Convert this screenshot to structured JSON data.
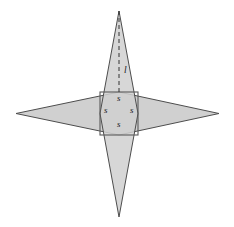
{
  "figure": {
    "background_color": "#ffffff",
    "fill_color": "#d0d0d0",
    "stroke_color": "#4d4d4d",
    "square_stroke_color": "#5a5a5a",
    "dashed_stroke_color": "#333333",
    "label_color": "#1a1a1a",
    "canvas": {
      "width": 234,
      "height": 227
    },
    "geometry": {
      "center": {
        "x": 119,
        "y": 113.5
      },
      "square": {
        "x": 100,
        "y": 92,
        "width": 38,
        "height": 43
      },
      "vertical_spike": {
        "apex_top": {
          "x": 119,
          "y": 11
        },
        "apex_bottom": {
          "x": 119,
          "y": 217
        },
        "left_waist": {
          "x": 100,
          "y": 113.5
        },
        "right_waist": {
          "x": 138,
          "y": 113.5
        }
      },
      "horizontal_spike": {
        "apex_left": {
          "x": 16,
          "y": 113.5
        },
        "apex_right": {
          "x": 219,
          "y": 113.5
        },
        "top_waist": {
          "x": 119,
          "y": 92
        },
        "bottom_waist": {
          "x": 119,
          "y": 135
        }
      },
      "dashed_line": {
        "from": {
          "x": 119,
          "y": 11
        },
        "to": {
          "x": 119,
          "y": 92
        }
      }
    },
    "labels": [
      {
        "id": "side-top",
        "text": "s",
        "x": 117,
        "y": 98,
        "name": "square-side-label-top"
      },
      {
        "id": "side-left",
        "text": "s",
        "x": 104,
        "y": 110,
        "name": "square-side-label-left"
      },
      {
        "id": "side-right",
        "text": "s",
        "x": 130,
        "y": 110,
        "name": "square-side-label-right"
      },
      {
        "id": "side-bottom",
        "text": "s",
        "x": 117,
        "y": 124,
        "name": "square-side-label-bottom"
      },
      {
        "id": "spike-height",
        "text": "l",
        "x": 124,
        "y": 71,
        "name": "spike-height-label"
      }
    ]
  }
}
